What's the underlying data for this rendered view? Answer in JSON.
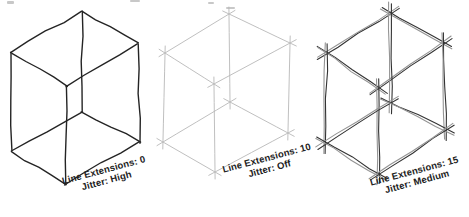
{
  "canvas": {
    "width": 469,
    "height": 217,
    "background": "#ffffff"
  },
  "scan_artifacts": {
    "color": "#9a9a9a",
    "marks": [
      {
        "x": 7,
        "y": 1,
        "w": 7,
        "h": 3
      },
      {
        "x": 130,
        "y": 0,
        "w": 10,
        "h": 2
      },
      {
        "x": 208,
        "y": 2,
        "w": 6,
        "h": 2
      },
      {
        "x": 226,
        "y": 7,
        "w": 9,
        "h": 2
      }
    ]
  },
  "edge_list": [
    [
      "T1",
      "T2"
    ],
    [
      "T1",
      "T3"
    ],
    [
      "T2",
      "T4"
    ],
    [
      "T3",
      "T4"
    ],
    [
      "T1",
      "B1"
    ],
    [
      "T2",
      "B2"
    ],
    [
      "T3",
      "B3"
    ],
    [
      "T4",
      "B4"
    ],
    [
      "B1",
      "B2"
    ],
    [
      "B1",
      "B3"
    ],
    [
      "B2",
      "B4"
    ],
    [
      "B3",
      "B4"
    ]
  ],
  "cubes": [
    {
      "name": "cube-extensions-0-jitter-high",
      "label_line1": "Line Extensions: 0",
      "label_line2": "Jitter: High",
      "line_extensions_value": 0,
      "jitter_value": "High",
      "extension": 0,
      "jitter": 1.3,
      "passes": 1,
      "pass_offset": 0,
      "stroke_width": 1.4,
      "stroke_colors": [
        "#242424"
      ],
      "seed": 7,
      "vertices": {
        "T1": [
          82,
          11
        ],
        "T2": [
          11,
          53
        ],
        "T3": [
          138,
          43
        ],
        "T4": [
          66,
          87
        ],
        "B1": [
          82,
          112
        ],
        "B2": [
          11,
          151
        ],
        "B3": [
          140,
          142
        ],
        "B4": [
          65,
          184
        ]
      }
    },
    {
      "name": "cube-extensions-10-jitter-off",
      "label_line1": "Line Extensions: 10",
      "label_line2": "Jitter: Off",
      "line_extensions_value": 10,
      "jitter_value": "Off",
      "extension": 7,
      "jitter": 0,
      "passes": 1,
      "pass_offset": 0,
      "stroke_width": 0.9,
      "stroke_colors": [
        "#b8b8b8"
      ],
      "seed": 11,
      "vertices": {
        "T1": [
          229,
          14
        ],
        "T2": [
          165,
          53
        ],
        "T3": [
          290,
          43
        ],
        "T4": [
          214,
          84
        ],
        "B1": [
          230,
          102
        ],
        "B2": [
          163,
          142
        ],
        "B3": [
          288,
          133
        ],
        "B4": [
          215,
          172
        ]
      }
    },
    {
      "name": "cube-extensions-15-jitter-medium",
      "label_line1": "Line Extensions: 15",
      "label_line2": "Jitter: Medium",
      "line_extensions_value": 15,
      "jitter_value": "Medium",
      "extension": 10,
      "jitter": 1.0,
      "passes": 2,
      "pass_offset": 1.7,
      "stroke_width": 1.1,
      "stroke_colors": [
        "#333333",
        "#949494"
      ],
      "seed": 23,
      "vertices": {
        "T1": [
          390,
          13
        ],
        "T2": [
          326,
          53
        ],
        "T3": [
          443,
          43
        ],
        "T4": [
          378,
          88
        ],
        "B1": [
          390,
          103
        ],
        "B2": [
          325,
          143
        ],
        "B3": [
          445,
          130
        ],
        "B4": [
          378,
          174
        ]
      }
    }
  ]
}
